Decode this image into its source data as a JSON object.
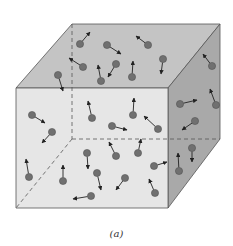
{
  "figure": {
    "caption": "(a)",
    "colors": {
      "top_face": "#c4c4c4",
      "front_face": "#e6e6e6",
      "right_face": "#a9a9a9",
      "edge": "#555555",
      "molecule": "#707070",
      "arrow": "#222222"
    },
    "molecules": [
      {
        "x": 80,
        "y": 44,
        "dx": 10,
        "dy": -12
      },
      {
        "x": 107,
        "y": 45,
        "dx": 14,
        "dy": 9
      },
      {
        "x": 148,
        "y": 45,
        "dx": -12,
        "dy": -9
      },
      {
        "x": 83,
        "y": 67,
        "dx": -14,
        "dy": -9
      },
      {
        "x": 116,
        "y": 64,
        "dx": -8,
        "dy": 13
      },
      {
        "x": 101,
        "y": 81,
        "dx": -3,
        "dy": -16
      },
      {
        "x": 132,
        "y": 77,
        "dx": 1,
        "dy": -16
      },
      {
        "x": 163,
        "y": 59,
        "dx": -2,
        "dy": 15
      },
      {
        "x": 58,
        "y": 75,
        "dx": 5,
        "dy": 16
      },
      {
        "x": 212,
        "y": 66,
        "dx": -9,
        "dy": -12
      },
      {
        "x": 216,
        "y": 105,
        "dx": -6,
        "dy": -16
      },
      {
        "x": 180,
        "y": 104,
        "dx": 17,
        "dy": -4
      },
      {
        "x": 195,
        "y": 121,
        "dx": -13,
        "dy": 9
      },
      {
        "x": 32,
        "y": 115,
        "dx": 13,
        "dy": 8
      },
      {
        "x": 52,
        "y": 132,
        "dx": -10,
        "dy": 11
      },
      {
        "x": 92,
        "y": 118,
        "dx": -4,
        "dy": -17
      },
      {
        "x": 133,
        "y": 115,
        "dx": 1,
        "dy": -17
      },
      {
        "x": 112,
        "y": 126,
        "dx": 15,
        "dy": 4
      },
      {
        "x": 158,
        "y": 129,
        "dx": -14,
        "dy": -13
      },
      {
        "x": 192,
        "y": 148,
        "dx": 0,
        "dy": 14
      },
      {
        "x": 179,
        "y": 171,
        "dx": -1,
        "dy": -18
      },
      {
        "x": 87,
        "y": 153,
        "dx": 1,
        "dy": 16
      },
      {
        "x": 116,
        "y": 156,
        "dx": -7,
        "dy": -14
      },
      {
        "x": 138,
        "y": 153,
        "dx": 3,
        "dy": -14
      },
      {
        "x": 154,
        "y": 166,
        "dx": 13,
        "dy": -4
      },
      {
        "x": 29,
        "y": 177,
        "dx": -3,
        "dy": -18
      },
      {
        "x": 63,
        "y": 181,
        "dx": 0,
        "dy": -16
      },
      {
        "x": 97,
        "y": 173,
        "dx": 4,
        "dy": 17
      },
      {
        "x": 125,
        "y": 178,
        "dx": -9,
        "dy": 12
      },
      {
        "x": 155,
        "y": 193,
        "dx": -6,
        "dy": -14
      },
      {
        "x": 91,
        "y": 196,
        "dx": -18,
        "dy": 3
      }
    ]
  }
}
